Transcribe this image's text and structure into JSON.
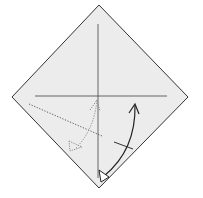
{
  "diagram": {
    "type": "origami-fold-step",
    "paper": {
      "shape": "square-diamond",
      "fill": "#ececec",
      "stroke": "#333333"
    },
    "creases": [
      {
        "name": "vertical-crease",
        "style": "solid"
      },
      {
        "name": "horizontal-crease",
        "style": "solid"
      }
    ],
    "fold_lines": [
      {
        "name": "valley-fold-line",
        "style": "dotted"
      }
    ],
    "arrows": [
      {
        "name": "fold-arrow-solid",
        "style": "solid",
        "direction": "bottom-corner-up-right"
      },
      {
        "name": "fold-arrow-dotted",
        "style": "dotted",
        "direction": "center-to-lower-left"
      }
    ],
    "marks": [
      {
        "name": "tick-mark",
        "style": "solid"
      }
    ]
  }
}
